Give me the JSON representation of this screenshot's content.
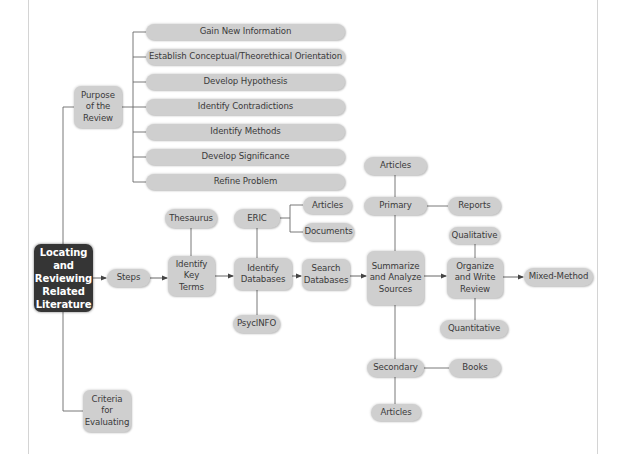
{
  "diagram": {
    "type": "concept-map",
    "root": {
      "label": "Locating\nand\nReviewing\nRelated\nLiterature"
    },
    "purpose": {
      "label": "Purpose\nof the\nReview",
      "items": [
        "Gain New Information",
        "Establish Conceptual/Theorethical Orientation",
        "Develop Hypothesis",
        "Identify Contradictions",
        "Identify Methods",
        "Develop Significance",
        "Refine Problem"
      ]
    },
    "steps": {
      "label": "Steps",
      "identify_key_terms": {
        "label": "Identify\nKey\nTerms",
        "thesaurus": "Thesaurus"
      },
      "identify_databases": {
        "label": "Identify\nDatabases",
        "eric": "ERIC",
        "eric_articles": "Articles",
        "eric_documents": "Documents",
        "psycinfo": "PsycINFO"
      },
      "search_databases": {
        "label": "Search\nDatabases"
      },
      "summarize": {
        "label": "Summarize\nand Analyze\nSources",
        "primary": "Primary",
        "primary_articles": "Articles",
        "primary_reports": "Reports",
        "secondary": "Secondary",
        "secondary_books": "Books",
        "secondary_articles": "Articles"
      },
      "organize": {
        "label": "Organize\nand Write\nReview",
        "qualitative": "Qualitative",
        "quantitative": "Quantitative",
        "mixed_method": "Mixed-Method"
      }
    },
    "criteria": {
      "label": "Criteria\nfor\nEvaluating"
    }
  },
  "colors": {
    "node_fill": "#cfcfcf",
    "node_text": "#3a3a3a",
    "root_fill": "#353535",
    "root_text": "#ffffff",
    "connector": "#555555",
    "frame": "#d4d4d4"
  }
}
